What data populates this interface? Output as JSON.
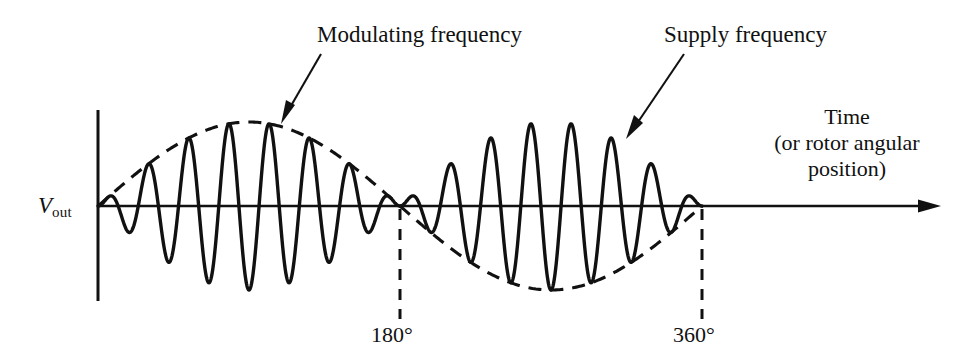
{
  "figure": {
    "title_alt": "Amplitude-modulated output voltage versus rotor angular position",
    "axis_color": "#111111",
    "curve_color": "#111111",
    "background": "#ffffff"
  },
  "labels": {
    "modulating_frequency": "Modulating frequency",
    "supply_frequency": "Supply frequency",
    "time_line1": "Time",
    "time_line2": "(or rotor angular",
    "time_line3": "position)",
    "vout_symbol": "V",
    "vout_subscript": "out",
    "angle_180": "180°",
    "angle_360": "360°"
  },
  "chart_data": {
    "type": "line",
    "title": "",
    "xlabel": "Time (or rotor angular position)",
    "ylabel": "Vout",
    "xlim": [
      0,
      360
    ],
    "ylim": [
      -1.15,
      1.15
    ],
    "grid": false,
    "legend": "none",
    "xticks": [
      180,
      360
    ],
    "xticklabels": [
      "180°",
      "360°"
    ],
    "yticks": [],
    "series": [
      {
        "name": "Modulated carrier (Vout)",
        "style": "solid",
        "description": "Supply-frequency carrier amplitude-modulated by the rotor position; envelope sign reverses after 180°",
        "carrier_cycles_per_half": 7.5,
        "carrier_cycles_total": 15,
        "amplitude_peak": 1.0
      },
      {
        "name": "Modulating envelope",
        "style": "dashed",
        "description": "One full cycle of the modulating (rotor position) sine over 0 to 360 degrees",
        "envelope_cycles": 1,
        "amplitude_peak": 1.0
      }
    ],
    "annotations": [
      {
        "text": "Modulating frequency",
        "points_to_x": 88,
        "points_to_y": 0.98
      },
      {
        "text": "Supply frequency",
        "points_to_x": 262,
        "points_to_y": 0.84
      }
    ]
  }
}
